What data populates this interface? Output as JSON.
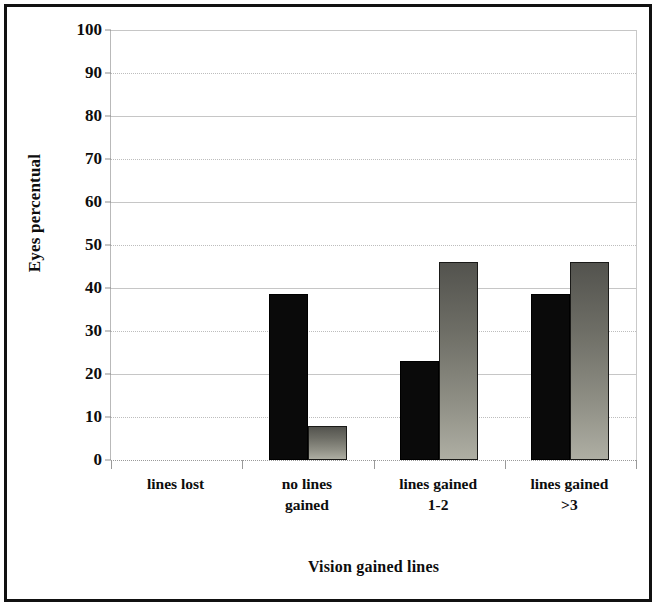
{
  "chart_data": {
    "type": "bar",
    "title": "",
    "xlabel": "Vision gained lines",
    "ylabel": "Eyes percentual",
    "categories": [
      "lines lost",
      "no lines\ngained",
      "lines gained\n1-2",
      "lines gained\n>3"
    ],
    "category_lines": [
      [
        "lines lost"
      ],
      [
        "no lines",
        "gained"
      ],
      [
        "lines gained",
        "1-2"
      ],
      [
        "lines gained",
        ">3"
      ]
    ],
    "series": [
      {
        "name": "series-1",
        "color": "#0a0a0a",
        "values": [
          0,
          38.5,
          23,
          38.5
        ]
      },
      {
        "name": "series-2",
        "color": "#8e8e84",
        "values": [
          0,
          8,
          46,
          46
        ]
      }
    ],
    "ylim": [
      0,
      100
    ],
    "ytick_step": 10,
    "yticks": [
      0,
      10,
      20,
      30,
      40,
      50,
      60,
      70,
      80,
      90,
      100
    ],
    "ytick_labels": [
      "0",
      "10",
      "20",
      "30",
      "40",
      "50",
      "60",
      "70",
      "80",
      "90",
      "100"
    ],
    "grid": true,
    "grid_axis": "y",
    "legend": false,
    "legend_position": "none",
    "frame": true,
    "frame_color": "#111111"
  }
}
